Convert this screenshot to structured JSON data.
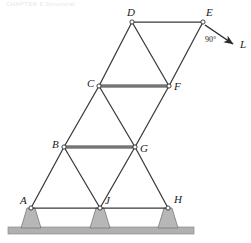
{
  "figure": {
    "title_fragment": "CHAPTER 6  Structural",
    "type": "truss-diagram",
    "width": 251,
    "height": 243
  },
  "colors": {
    "member": "#3a3a3a",
    "chord_member": "#8a8a8a",
    "node_fill": "#ffffff",
    "node_stroke": "#2b2b2b",
    "support_fill": "#b7b7b7",
    "support_stroke": "#6e6e6e",
    "ground_fill": "#b0b0b0",
    "ground_stroke": "#8c8c8c",
    "label_color": "#1a1a1a",
    "load_arrow": "#2b2b2b"
  },
  "joints": [
    {
      "id": "A",
      "label": "A",
      "x": 31,
      "y": 208,
      "label_dx": -11,
      "label_dy": -4,
      "supported": true
    },
    {
      "id": "J",
      "label": "J",
      "x": 100,
      "y": 208,
      "label_dx": 5,
      "label_dy": -4,
      "supported": true
    },
    {
      "id": "H",
      "label": "H",
      "x": 168,
      "y": 208,
      "label_dx": 6,
      "label_dy": -5,
      "supported": true
    },
    {
      "id": "B",
      "label": "B",
      "x": 64,
      "y": 147,
      "label_dx": -12,
      "label_dy": 1,
      "supported": false
    },
    {
      "id": "G",
      "label": "G",
      "x": 135,
      "y": 147,
      "label_dx": 5,
      "label_dy": 5,
      "supported": false
    },
    {
      "id": "C",
      "label": "C",
      "x": 99,
      "y": 86,
      "label_dx": -12,
      "label_dy": 1,
      "supported": false
    },
    {
      "id": "F",
      "label": "F",
      "x": 169,
      "y": 86,
      "label_dx": 5,
      "label_dy": 4,
      "supported": false
    },
    {
      "id": "D",
      "label": "D",
      "x": 132,
      "y": 22,
      "label_dx": -5,
      "label_dy": -6,
      "supported": false
    },
    {
      "id": "E",
      "label": "E",
      "x": 203,
      "y": 22,
      "label_dx": 3,
      "label_dy": -6,
      "supported": false
    }
  ],
  "members": [
    {
      "from": "A",
      "to": "J",
      "style": "thin"
    },
    {
      "from": "J",
      "to": "H",
      "style": "thin"
    },
    {
      "from": "A",
      "to": "B",
      "style": "thin"
    },
    {
      "from": "B",
      "to": "J",
      "style": "thin"
    },
    {
      "from": "J",
      "to": "G",
      "style": "thin"
    },
    {
      "from": "G",
      "to": "H",
      "style": "thin"
    },
    {
      "from": "B",
      "to": "G",
      "style": "chord"
    },
    {
      "from": "B",
      "to": "C",
      "style": "thin"
    },
    {
      "from": "C",
      "to": "G",
      "style": "thin"
    },
    {
      "from": "G",
      "to": "F",
      "style": "thin"
    },
    {
      "from": "C",
      "to": "F",
      "style": "chord"
    },
    {
      "from": "C",
      "to": "D",
      "style": "thin"
    },
    {
      "from": "D",
      "to": "F",
      "style": "thin"
    },
    {
      "from": "F",
      "to": "E",
      "style": "thin"
    },
    {
      "from": "D",
      "to": "E",
      "style": "thin"
    }
  ],
  "supports": [
    {
      "joint": "A",
      "top_half_width": 4,
      "bottom_half_width": 10,
      "height": 19
    },
    {
      "joint": "J",
      "top_half_width": 4,
      "bottom_half_width": 10,
      "height": 19
    },
    {
      "joint": "H",
      "top_half_width": 4,
      "bottom_half_width": 10,
      "height": 19
    }
  ],
  "ground": {
    "x": 8,
    "y": 227,
    "width": 186,
    "height": 7
  },
  "load": {
    "label": "L",
    "label_x": 240,
    "label_y": 48,
    "origin_joint": "E",
    "start_x": 205,
    "start_y": 25,
    "end_x": 233,
    "end_y": 44,
    "angle_label": "90°",
    "angle_label_x": 205,
    "angle_label_y": 42
  }
}
